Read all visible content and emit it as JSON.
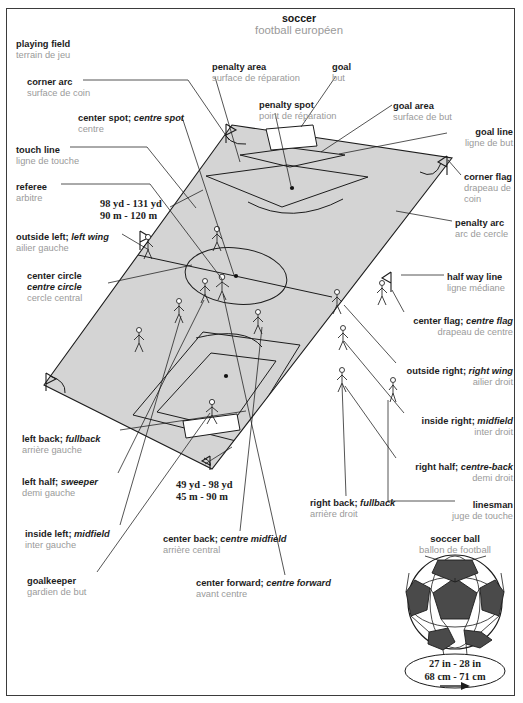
{
  "page": {
    "cut_header": "SPORTS GAMES",
    "title": {
      "en": "soccer",
      "fr": "football européen"
    }
  },
  "labels": [
    {
      "key": "playing-field",
      "en": "playing field",
      "fr": "terrain de jeu",
      "align": "left",
      "x": 16,
      "y": 39
    },
    {
      "key": "corner-arc",
      "en": "corner arc",
      "fr": "surface de coin",
      "align": "left",
      "x": 27,
      "y": 77
    },
    {
      "key": "center-spot",
      "en": "center spot; <i>centre spot</i>",
      "fr": "centre",
      "align": "left",
      "x": 78,
      "y": 113
    },
    {
      "key": "touch-line",
      "en": "touch line",
      "fr": "ligne de touche",
      "align": "left",
      "x": 16,
      "y": 145
    },
    {
      "key": "referee",
      "en": "referee",
      "fr": "arbitre",
      "align": "left",
      "x": 16,
      "y": 182
    },
    {
      "key": "outside-left",
      "en": "outside left; <i>left wing</i>",
      "fr": "ailier gauche",
      "align": "left",
      "x": 16,
      "y": 232
    },
    {
      "key": "center-circle",
      "en": "center circle<br><i>centre circle</i>",
      "fr": "cercle central",
      "align": "left",
      "x": 27,
      "y": 271
    },
    {
      "key": "left-back",
      "en": "left back; <i>fullback</i>",
      "fr": "arrière gauche",
      "align": "left",
      "x": 22,
      "y": 434
    },
    {
      "key": "left-half",
      "en": "left half; <i>sweeper</i>",
      "fr": "demi gauche",
      "align": "left",
      "x": 22,
      "y": 477
    },
    {
      "key": "inside-left",
      "en": "inside left; <i>midfield</i>",
      "fr": "inter gauche",
      "align": "left",
      "x": 25,
      "y": 529
    },
    {
      "key": "goalkeeper",
      "en": "goalkeeper",
      "fr": "gardien de but",
      "align": "left",
      "x": 27,
      "y": 576
    },
    {
      "key": "penalty-area",
      "en": "penalty area",
      "fr": "surface de réparation",
      "align": "left",
      "x": 212,
      "y": 62
    },
    {
      "key": "penalty-spot",
      "en": "penalty spot",
      "fr": "point de réparation",
      "align": "left",
      "x": 259,
      "y": 100
    },
    {
      "key": "goal",
      "en": "goal",
      "fr": "but",
      "align": "left",
      "x": 332,
      "y": 62
    },
    {
      "key": "goal-area",
      "en": "goal area",
      "fr": "surface de but",
      "align": "left",
      "x": 393,
      "y": 101
    },
    {
      "key": "goal-line",
      "en": "goal line",
      "fr": "ligne de but",
      "align": "right",
      "x": 513,
      "y": 127
    },
    {
      "key": "corner-flag",
      "en": "corner flag",
      "fr": "drapeau de<br>coin",
      "align": "left",
      "x": 464,
      "y": 172
    },
    {
      "key": "penalty-arc",
      "en": "penalty arc",
      "fr": "arc de cercle",
      "align": "left",
      "x": 455,
      "y": 218
    },
    {
      "key": "half-way-line",
      "en": "half way line",
      "fr": "ligne médiane",
      "align": "left",
      "x": 447,
      "y": 272
    },
    {
      "key": "center-flag",
      "en": "center flag; <i>centre flag</i>",
      "fr": "drapeau de centre",
      "align": "right",
      "x": 513,
      "y": 316
    },
    {
      "key": "outside-right",
      "en": "outside right; <i>right wing</i>",
      "fr": "ailier droit",
      "align": "right",
      "x": 513,
      "y": 366
    },
    {
      "key": "inside-right",
      "en": "inside right; <i>midfield</i>",
      "fr": "inter droit",
      "align": "right",
      "x": 513,
      "y": 416
    },
    {
      "key": "right-half",
      "en": "right half; <i>centre-back</i>",
      "fr": "demi droit",
      "align": "right",
      "x": 513,
      "y": 462
    },
    {
      "key": "linesman",
      "en": "linesman",
      "fr": "juge de touche",
      "align": "right",
      "x": 513,
      "y": 500
    },
    {
      "key": "right-back",
      "en": "right back; <i>fullback</i>",
      "fr": "arrière droit",
      "align": "left",
      "x": 310,
      "y": 498
    },
    {
      "key": "center-back",
      "en": "center back; <i>centre midfield</i>",
      "fr": "arrière central",
      "align": "left",
      "x": 163,
      "y": 534
    },
    {
      "key": "center-forward",
      "en": "center forward; <i>centre forward</i>",
      "fr": "avant centre",
      "align": "left",
      "x": 196,
      "y": 578
    }
  ],
  "measurements": [
    {
      "key": "field-length",
      "line1": "98 yd - 131 yd",
      "line2": "90 m - 120 m",
      "x": 100,
      "y": 198
    },
    {
      "key": "field-width",
      "line1": "49 yd - 98 yd",
      "line2": "45 m - 90 m",
      "x": 176,
      "y": 479
    }
  ],
  "ball": {
    "caption_en": "soccer ball",
    "caption_fr": "ballon de football",
    "dim_line1": "27 in - 28 in",
    "dim_line2": "68 cm - 71 cm"
  },
  "colors": {
    "field_fill": "#d4d4d4",
    "line": "#1c1c1c",
    "french_text": "#9a9a9a",
    "english_text": "#1c1c1c",
    "ball_dark": "#4a4a4a"
  }
}
